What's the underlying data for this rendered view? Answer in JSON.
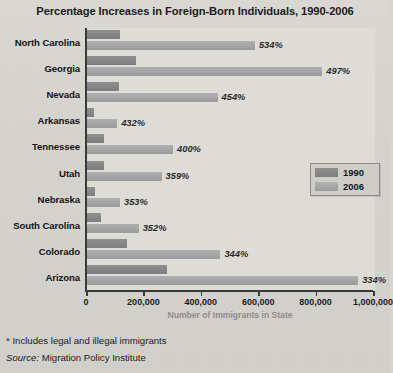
{
  "chart_data": {
    "type": "bar",
    "orientation": "horizontal",
    "title": "Percentage Increases in Foreign-Born Individuals, 1990-2006",
    "xlabel": "Number of Immigrants in State",
    "ylabel": "",
    "xlim": [
      0,
      1000000
    ],
    "xticks": [
      0,
      200000,
      400000,
      600000,
      800000,
      1000000
    ],
    "xticklabels": [
      "0",
      "200,000",
      "400,000",
      "600,000",
      "800,000",
      "1,000,000"
    ],
    "grid": false,
    "legend_position": "center-right",
    "categories": [
      "North Carolina",
      "Georgia",
      "Nevada",
      "Arkansas",
      "Tennessee",
      "Utah",
      "Nebraska",
      "South Carolina",
      "Colorado",
      "Arizona"
    ],
    "series": [
      {
        "name": "1990",
        "color": "#858585",
        "values": [
          115000,
          170000,
          110000,
          25000,
          60000,
          60000,
          28000,
          50000,
          140000,
          280000
        ]
      },
      {
        "name": "2006",
        "color": "#a3a3a3",
        "values": [
          585000,
          820000,
          455000,
          105000,
          300000,
          260000,
          115000,
          180000,
          465000,
          945000
        ]
      }
    ],
    "annotations": [
      {
        "category": "North Carolina",
        "label": "534%"
      },
      {
        "category": "Georgia",
        "label": "497%"
      },
      {
        "category": "Nevada",
        "label": "454%"
      },
      {
        "category": "Arkansas",
        "label": "432%"
      },
      {
        "category": "Tennessee",
        "label": "400%"
      },
      {
        "category": "Utah",
        "label": "359%"
      },
      {
        "category": "Nebraska",
        "label": "353%"
      },
      {
        "category": "South Carolina",
        "label": "352%"
      },
      {
        "category": "Colorado",
        "label": "344%"
      },
      {
        "category": "Arizona",
        "label": "334%"
      }
    ]
  },
  "legend": {
    "entries": [
      {
        "label": "1990",
        "color": "#858585"
      },
      {
        "label": "2006",
        "color": "#a3a3a3"
      }
    ]
  },
  "footnotes": {
    "asterisk_note": "* Includes legal and illegal immigrants",
    "source_prefix": "Source:",
    "source_name": "Migration Policy Institute"
  },
  "colors": {
    "page_background": "#d7d5d0",
    "plot_background": "#dedcd7",
    "axis": "#3a3a3a",
    "series_1990": "#858585",
    "series_2006": "#a3a3a3",
    "caption_gray": "#8e8c88",
    "text": "#1b1b1b"
  }
}
